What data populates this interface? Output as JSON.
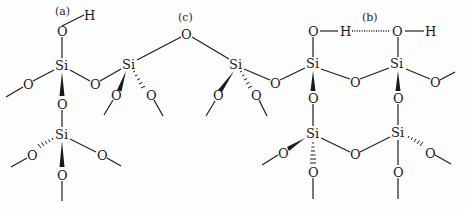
{
  "figure": {
    "type": "silica surface structure",
    "labels": {
      "a": "(a)",
      "b": "(b)",
      "c": "(c)"
    },
    "atoms": {
      "si": "Si",
      "o": "O",
      "h": "H"
    },
    "label_meanings": {
      "a": "isolated silanol",
      "b": "hydrogen-bonded vicinal silanols",
      "c": "siloxane bridge"
    },
    "caption": ""
  },
  "colors": {
    "ink": "#1a1a1a",
    "background": "#fdfdfd"
  }
}
